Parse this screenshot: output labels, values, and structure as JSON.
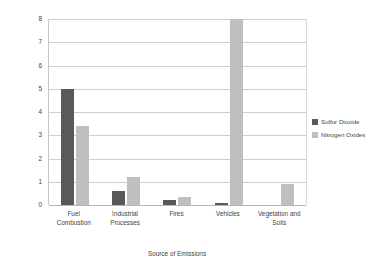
{
  "chart_data": {
    "type": "bar",
    "title": "",
    "xlabel": "Source of Emissions",
    "ylabel": "Total Emissions (millions of metric tons)",
    "categories": [
      "Fuel Combustion",
      "Industrial Processes",
      "Fires",
      "Vehicles",
      "Vegetation and Soils"
    ],
    "category_lines": [
      [
        "Fuel",
        "Combustion"
      ],
      [
        "Industrial",
        "Processes"
      ],
      [
        "Fires"
      ],
      [
        "Vehicles"
      ],
      [
        "Vegetation and",
        "Soils"
      ]
    ],
    "series": [
      {
        "name": "Sulfur Dioxide",
        "color": "#595959",
        "values": [
          5.0,
          0.6,
          0.2,
          0.1,
          0.0
        ]
      },
      {
        "name": "Nitrogen Oxides",
        "color": "#bfbfbf",
        "values": [
          3.4,
          1.2,
          0.35,
          8.0,
          0.9
        ]
      }
    ],
    "ylim": [
      0,
      8
    ],
    "yticks": [
      0,
      1,
      2,
      3,
      4,
      5,
      6,
      7,
      8
    ],
    "ytick_labels": [
      "0",
      "1",
      "2",
      "3",
      "4",
      "5",
      "6",
      "7",
      "8"
    ],
    "grid": "horizontal",
    "legend_position": "right",
    "plot_background": "#ffffff"
  }
}
